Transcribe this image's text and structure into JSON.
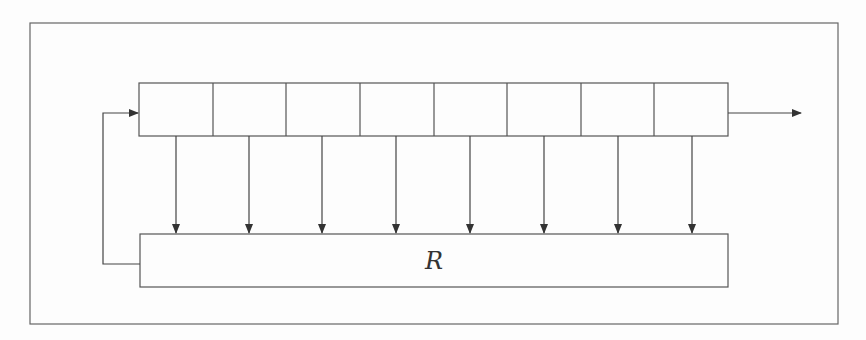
{
  "diagram": {
    "title": "",
    "register": {
      "cell_count": 8,
      "cells": [
        "",
        "",
        "",
        "",
        "",
        "",
        "",
        ""
      ]
    },
    "function_box": {
      "label": "R"
    },
    "colors": {
      "line": "#555555",
      "background": "#fdfdfd"
    },
    "edges": [
      {
        "from": "register-cells",
        "to": "R",
        "type": "tap",
        "count": 8
      },
      {
        "from": "R",
        "to": "register-cell-1",
        "type": "feedback"
      },
      {
        "from": "register-cell-8",
        "to": "output",
        "type": "output"
      }
    ]
  }
}
